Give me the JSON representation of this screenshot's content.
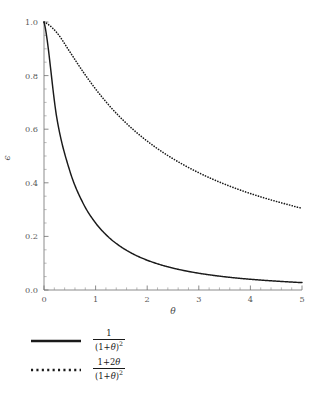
{
  "chart_data": {
    "type": "line",
    "title": "",
    "subtitle": "",
    "xlabel": "θ",
    "ylabel": "ϵ",
    "xlim": [
      0,
      5
    ],
    "ylim": [
      0.0,
      1.0
    ],
    "grid": false,
    "legend_position": "below",
    "x_ticks": [
      "0",
      "1",
      "2",
      "3",
      "4",
      "5"
    ],
    "x_tick_values": [
      0,
      1,
      2,
      3,
      4,
      5
    ],
    "y_ticks": [
      "0.0",
      "0.2",
      "0.4",
      "0.6",
      "0.8",
      "1.0"
    ],
    "y_tick_values": [
      0.0,
      0.2,
      0.4,
      0.6,
      0.8,
      1.0
    ],
    "x_minor_per_interval": 5,
    "y_minor_per_interval": 4,
    "x": [
      0,
      0.25,
      0.5,
      0.75,
      1,
      1.25,
      1.5,
      1.75,
      2,
      2.25,
      2.5,
      2.75,
      3,
      3.25,
      3.5,
      3.75,
      4,
      4.25,
      4.5,
      4.75,
      5
    ],
    "series": [
      {
        "name": "1/(1+θ)^2",
        "style": "solid",
        "color": "#1a1a1a",
        "values": [
          1.0,
          0.64,
          0.4444,
          0.3265,
          0.25,
          0.1975,
          0.16,
          0.1322,
          0.1111,
          0.0947,
          0.0816,
          0.0711,
          0.0625,
          0.0554,
          0.0494,
          0.0443,
          0.04,
          0.0363,
          0.0331,
          0.0302,
          0.0278
        ]
      },
      {
        "name": "(1+2θ)/(1+θ)^2",
        "style": "dotted",
        "color": "#1a1a1a",
        "values": [
          1.0,
          0.96,
          0.8889,
          0.8163,
          0.75,
          0.6914,
          0.64,
          0.595,
          0.5556,
          0.5207,
          0.4898,
          0.4622,
          0.4375,
          0.4152,
          0.3951,
          0.3767,
          0.36,
          0.3447,
          0.3306,
          0.3176,
          0.3056
        ]
      }
    ]
  },
  "axes": {
    "x_label": "θ",
    "y_label": "ϵ",
    "x_tick_labels": [
      "0",
      "1",
      "2",
      "3",
      "4",
      "5"
    ],
    "y_tick_labels": [
      "0.0",
      "0.2",
      "0.4",
      "0.6",
      "0.8",
      "1.0"
    ]
  },
  "legend": {
    "entries": [
      {
        "style": "solid",
        "numerator": "1",
        "denominator_open": "(1+",
        "denominator_var": "θ",
        "denominator_close": ")",
        "denominator_exp": "2"
      },
      {
        "style": "dotted",
        "numerator_pre": "1+2",
        "numerator_var": "θ",
        "denominator_open": "(1+",
        "denominator_var": "θ",
        "denominator_close": ")",
        "denominator_exp": "2"
      }
    ]
  },
  "colors": {
    "curve": "#1a1a1a",
    "axis": "#6f6f6f",
    "tick_label": "#5a5a5a",
    "background": "#ffffff"
  }
}
